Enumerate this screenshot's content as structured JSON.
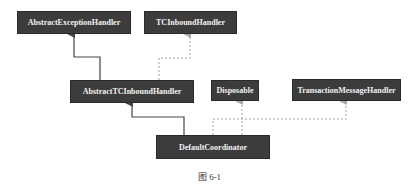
{
  "diagram": {
    "type": "uml-class-hierarchy",
    "nodes": [
      {
        "id": "abstract-exception-handler",
        "label": "AbstractExceptionHandler"
      },
      {
        "id": "tc-inbound-handler",
        "label": "TCInboundHandler"
      },
      {
        "id": "abstract-tc-inbound-handler",
        "label": "AbstractTCInboundHandler"
      },
      {
        "id": "disposable",
        "label": "Disposable"
      },
      {
        "id": "transaction-message-handler",
        "label": "TransactionMessageHandler"
      },
      {
        "id": "default-coordinator",
        "label": "DefaultCoordinator"
      }
    ],
    "edges": [
      {
        "from": "AbstractTCInboundHandler",
        "to": "AbstractExceptionHandler",
        "kind": "extends",
        "style": "solid"
      },
      {
        "from": "AbstractTCInboundHandler",
        "to": "TCInboundHandler",
        "kind": "implements",
        "style": "dashed"
      },
      {
        "from": "DefaultCoordinator",
        "to": "AbstractTCInboundHandler",
        "kind": "extends",
        "style": "solid"
      },
      {
        "from": "DefaultCoordinator",
        "to": "Disposable",
        "kind": "implements",
        "style": "dashed"
      },
      {
        "from": "DefaultCoordinator",
        "to": "TransactionMessageHandler",
        "kind": "implements",
        "style": "dashed"
      }
    ],
    "colors": {
      "box_fill": "#3c3c3c",
      "box_text": "#f2f2f2",
      "solid_line": "#444444",
      "dashed_line": "#a0a0a0"
    }
  },
  "caption": "图 6-1"
}
